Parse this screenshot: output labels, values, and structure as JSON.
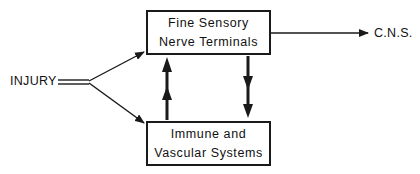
{
  "diagram": {
    "input_label": "INJURY",
    "output_label": "C.N.S.",
    "nodes": [
      {
        "id": "sensory",
        "lines": [
          "Fine Sensory",
          "Nerve Terminals"
        ]
      },
      {
        "id": "immune",
        "lines": [
          "Immune and",
          "Vascular Systems"
        ]
      }
    ],
    "edges": [
      {
        "from": "INJURY",
        "to": "sensory",
        "style": "single-arrow"
      },
      {
        "from": "INJURY",
        "to": "immune",
        "style": "single-arrow"
      },
      {
        "from": "immune",
        "to": "sensory",
        "style": "bold-double-arrowhead"
      },
      {
        "from": "sensory",
        "to": "immune",
        "style": "bold-double-arrowhead"
      },
      {
        "from": "sensory",
        "to": "C.N.S.",
        "style": "single-arrow"
      }
    ],
    "colors": {
      "stroke": "#1a1a1a",
      "background": "#ffffff"
    }
  }
}
